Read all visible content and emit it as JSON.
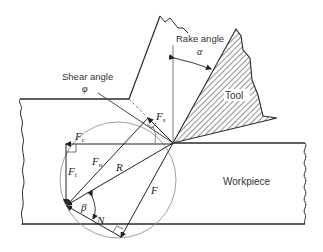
{
  "figure": {
    "labels": {
      "rake_angle": "Rake angle",
      "rake_symbol": "α",
      "shear_angle": "Shear angle",
      "shear_symbol": "φ",
      "tool": "Tool",
      "workpiece": "Workpiece",
      "Fs": "F",
      "Fs_sub": "s",
      "Fc": "F",
      "Fc_sub": "c",
      "Ft": "F",
      "Ft_sub": "t",
      "Fn": "F",
      "Fn_sub": "n",
      "R": "R",
      "F": "F",
      "N": "N",
      "beta": "β"
    },
    "colors": {
      "line": "#2a2a2a",
      "thin": "#777777",
      "background": "#ffffff"
    }
  }
}
